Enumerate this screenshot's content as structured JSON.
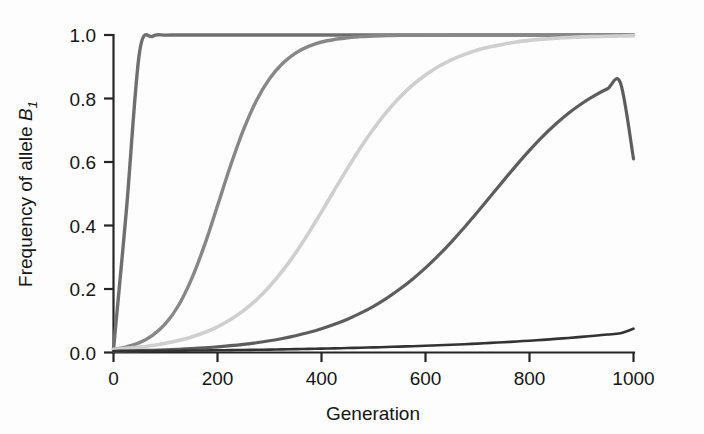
{
  "chart_data": {
    "type": "line",
    "title": "",
    "xlabel": "Generation",
    "ylabel": "Frequency of allele B1",
    "ylabel_parts": {
      "main": "Frequency of allele ",
      "symbol": "B",
      "subscript": "1"
    },
    "xlim": [
      0,
      1000
    ],
    "ylim": [
      0.0,
      1.0
    ],
    "xticks": [
      0,
      200,
      400,
      600,
      800,
      1000
    ],
    "xtick_labels": [
      "0",
      "200",
      "400",
      "600",
      "800",
      "1000"
    ],
    "yticks": [
      0.0,
      0.2,
      0.4,
      0.6,
      0.8,
      1.0
    ],
    "ytick_labels": [
      "0.0",
      "0.2",
      "0.4",
      "0.6",
      "0.8",
      "1.0"
    ],
    "grid": false,
    "legend": "none",
    "background": "#fdfdfd",
    "x": [
      0,
      25,
      50,
      75,
      100,
      125,
      150,
      175,
      200,
      225,
      250,
      275,
      300,
      325,
      350,
      375,
      400,
      425,
      450,
      475,
      500,
      525,
      550,
      575,
      600,
      625,
      650,
      675,
      700,
      725,
      750,
      775,
      800,
      825,
      850,
      875,
      900,
      925,
      950,
      975,
      1000
    ],
    "series": [
      {
        "name": "curve-1",
        "color": "#6f6f6f",
        "linewidth": 3.4,
        "midpoint_generation": 30,
        "final_value": 1.0,
        "values": [
          0.01,
          0.452,
          0.945,
          0.996,
          0.9997,
          1.0,
          1.0,
          1.0,
          1.0,
          1.0,
          1.0,
          1.0,
          1.0,
          1.0,
          1.0,
          1.0,
          1.0,
          1.0,
          1.0,
          1.0,
          1.0,
          1.0,
          1.0,
          1.0,
          1.0,
          1.0,
          1.0,
          1.0,
          1.0,
          1.0,
          1.0,
          1.0,
          1.0,
          1.0,
          1.0,
          1.0,
          1.0,
          1.0,
          1.0,
          1.0,
          1.0
        ]
      },
      {
        "name": "curve-2",
        "color": "#878787",
        "linewidth": 3.4,
        "midpoint_generation": 265,
        "final_value": 1.0,
        "values": [
          0.01,
          0.018,
          0.031,
          0.054,
          0.091,
          0.148,
          0.231,
          0.338,
          0.462,
          0.588,
          0.702,
          0.794,
          0.862,
          0.91,
          0.943,
          0.964,
          0.978,
          0.986,
          0.991,
          0.995,
          0.997,
          0.998,
          0.999,
          0.999,
          0.9995,
          0.9997,
          0.9998,
          0.9999,
          1.0,
          1.0,
          1.0,
          1.0,
          1.0,
          1.0,
          1.0,
          1.0,
          1.0,
          1.0,
          1.0,
          1.0,
          1.0
        ]
      },
      {
        "name": "curve-3",
        "color": "#cfcfcf",
        "linewidth": 3.6,
        "midpoint_generation": 495,
        "final_value": 1.0,
        "values": [
          0.01,
          0.013,
          0.017,
          0.022,
          0.029,
          0.038,
          0.049,
          0.063,
          0.081,
          0.104,
          0.132,
          0.166,
          0.208,
          0.257,
          0.313,
          0.376,
          0.443,
          0.512,
          0.58,
          0.645,
          0.704,
          0.757,
          0.803,
          0.842,
          0.874,
          0.901,
          0.922,
          0.939,
          0.953,
          0.963,
          0.971,
          0.978,
          0.983,
          0.987,
          0.99,
          0.992,
          0.994,
          0.995,
          0.996,
          0.997,
          0.998
        ]
      },
      {
        "name": "curve-4",
        "color": "#5d5d5d",
        "linewidth": 3.2,
        "midpoint_generation": 1060,
        "final_value": 0.61,
        "values": [
          0.004,
          0.0048,
          0.0058,
          0.007,
          0.0085,
          0.0102,
          0.0123,
          0.0148,
          0.0178,
          0.0214,
          0.0257,
          0.0308,
          0.0369,
          0.0441,
          0.0527,
          0.0628,
          0.0747,
          0.0886,
          0.1049,
          0.1238,
          0.1456,
          0.1706,
          0.199,
          0.231,
          0.2667,
          0.306,
          0.3487,
          0.3944,
          0.4424,
          0.4918,
          0.5414,
          0.5901,
          0.6366,
          0.6798,
          0.7189,
          0.7536,
          0.7836,
          0.8092,
          0.8307,
          0.8486,
          0.61
        ]
      },
      {
        "name": "curve-5",
        "color": "#333333",
        "linewidth": 2.6,
        "midpoint_generation": 2600,
        "final_value": 0.075,
        "values": [
          0.004,
          0.0043,
          0.0046,
          0.0049,
          0.0053,
          0.0057,
          0.0061,
          0.0065,
          0.007,
          0.0075,
          0.008,
          0.0086,
          0.0092,
          0.0099,
          0.0106,
          0.0114,
          0.0122,
          0.0131,
          0.014,
          0.015,
          0.0161,
          0.0173,
          0.0185,
          0.0199,
          0.0213,
          0.0228,
          0.0245,
          0.0262,
          0.0281,
          0.0302,
          0.0323,
          0.0347,
          0.0372,
          0.0399,
          0.0428,
          0.0459,
          0.0492,
          0.0528,
          0.0566,
          0.0607,
          0.075
        ]
      }
    ]
  },
  "axes": {
    "x_axis_title": "Generation",
    "y_axis_title_main": "Frequency of allele ",
    "y_axis_symbol": "B",
    "y_axis_subscript": "1"
  }
}
